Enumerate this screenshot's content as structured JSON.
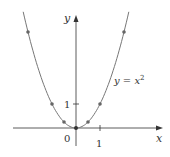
{
  "chart_data": {
    "type": "line",
    "title": "",
    "xlabel": "x",
    "ylabel": "y",
    "curve_label": "y = x²",
    "function": "y = x^2",
    "x_ticks": [
      "1"
    ],
    "y_ticks": [
      "1"
    ],
    "origin_label": "0",
    "points": [
      {
        "x": -2,
        "y": 4
      },
      {
        "x": -1,
        "y": 1
      },
      {
        "x": -0.5,
        "y": 0.25
      },
      {
        "x": 0,
        "y": 0
      },
      {
        "x": 0.5,
        "y": 0.25
      },
      {
        "x": 1,
        "y": 1
      },
      {
        "x": 2,
        "y": 4
      }
    ],
    "xlim": [
      -2.5,
      2.5
    ],
    "ylim": [
      -0.5,
      4.6
    ],
    "grid": false
  },
  "labels": {
    "x_axis": "x",
    "y_axis": "y",
    "origin": "0",
    "x_tick": "1",
    "y_tick": "1",
    "curve_y": "y = x",
    "curve_exp": "2"
  },
  "colors": {
    "curve": "#777777",
    "axes": "#333333",
    "points": "#666666"
  }
}
